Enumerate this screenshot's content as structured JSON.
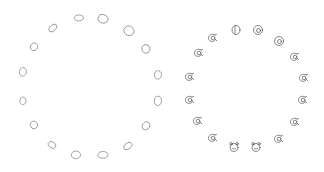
{
  "canvas": {
    "width": 324,
    "height": 172,
    "background": "#ffffff"
  },
  "left_ring": {
    "name": "blob-ring",
    "stroke": "#8a8a8a",
    "items": [
      {
        "x": 79,
        "y": 18,
        "rx": 4.5,
        "ry": 3.5,
        "rot": 0
      },
      {
        "x": 103,
        "y": 19,
        "rx": 5,
        "ry": 5,
        "rot": 20
      },
      {
        "x": 53,
        "y": 28,
        "rx": 4.5,
        "ry": 3.5,
        "rot": -40
      },
      {
        "x": 129,
        "y": 31,
        "rx": 5,
        "ry": 5.5,
        "rot": 30
      },
      {
        "x": 34,
        "y": 47,
        "rx": 3.5,
        "ry": 4.5,
        "rot": 30
      },
      {
        "x": 146,
        "y": 49,
        "rx": 4,
        "ry": 5,
        "rot": -20
      },
      {
        "x": 23,
        "y": 72,
        "rx": 3.5,
        "ry": 5,
        "rot": 0
      },
      {
        "x": 158,
        "y": 75,
        "rx": 3.5,
        "ry": 5,
        "rot": 0
      },
      {
        "x": 23,
        "y": 101,
        "rx": 3,
        "ry": 4.5,
        "rot": 0
      },
      {
        "x": 158,
        "y": 101,
        "rx": 3.5,
        "ry": 5.5,
        "rot": 0
      },
      {
        "x": 34,
        "y": 125,
        "rx": 3.5,
        "ry": 4.5,
        "rot": -35
      },
      {
        "x": 146,
        "y": 126,
        "rx": 3.5,
        "ry": 5,
        "rot": 35
      },
      {
        "x": 52,
        "y": 145,
        "rx": 4,
        "ry": 3.5,
        "rot": 35
      },
      {
        "x": 128,
        "y": 146,
        "rx": 4.5,
        "ry": 3.5,
        "rot": -35
      },
      {
        "x": 76,
        "y": 155,
        "rx": 4.5,
        "ry": 4.5,
        "rot": 0
      },
      {
        "x": 103,
        "y": 155,
        "rx": 5,
        "ry": 4,
        "rot": 0
      }
    ]
  },
  "right_ring": {
    "name": "doodle-ring",
    "stroke": "#555555",
    "items": [
      {
        "x": 236,
        "y": 30,
        "kind": "blob"
      },
      {
        "x": 258,
        "y": 30,
        "kind": "spiral"
      },
      {
        "x": 212,
        "y": 38,
        "kind": "critter"
      },
      {
        "x": 279,
        "y": 41,
        "kind": "spiral"
      },
      {
        "x": 198,
        "y": 53,
        "kind": "critter"
      },
      {
        "x": 294,
        "y": 57,
        "kind": "critter"
      },
      {
        "x": 189,
        "y": 77,
        "kind": "critter"
      },
      {
        "x": 303,
        "y": 78,
        "kind": "critter"
      },
      {
        "x": 189,
        "y": 100,
        "kind": "critter"
      },
      {
        "x": 302,
        "y": 100,
        "kind": "critter"
      },
      {
        "x": 197,
        "y": 121,
        "kind": "critter"
      },
      {
        "x": 294,
        "y": 122,
        "kind": "critter"
      },
      {
        "x": 212,
        "y": 138,
        "kind": "critter"
      },
      {
        "x": 278,
        "y": 139,
        "kind": "critter"
      },
      {
        "x": 234,
        "y": 147,
        "kind": "bear"
      },
      {
        "x": 256,
        "y": 147,
        "kind": "bear"
      }
    ]
  }
}
